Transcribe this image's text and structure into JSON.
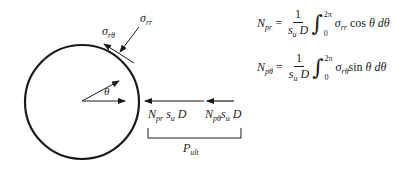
{
  "diagram": {
    "type": "free-body diagram of pipe cross-section",
    "circle": {
      "cx": 82,
      "cy": 102,
      "r": 57
    },
    "labels": {
      "sigma_rr": {
        "base": "σ",
        "sub": "rr"
      },
      "sigma_rtheta": {
        "base": "σ",
        "sub": "rθ"
      },
      "theta": "θ",
      "force_pr": {
        "N": "N",
        "N_sub": "pr",
        "s": "s",
        "s_sub": "u",
        "D": "D"
      },
      "force_ptheta": {
        "N": "N",
        "N_sub": "pθ",
        "s": "s",
        "s_sub": "u",
        "D": "D"
      },
      "p_ult": {
        "base": "P",
        "sub": "ult"
      }
    },
    "equations": [
      {
        "lhs": "N",
        "lhs_sub": "pr",
        "eq": "=",
        "numerator": "1",
        "den_s": "s",
        "den_s_sub": "u",
        "den_D": "D",
        "integral": "∫",
        "upper": "2π",
        "lower": "0",
        "sigma": "σ",
        "sigma_sub": "rr",
        "trig": "cos",
        "var": "θ",
        "d": "dθ"
      },
      {
        "lhs": "N",
        "lhs_sub": "pθ",
        "eq": "=",
        "numerator": "1",
        "den_s": "s",
        "den_s_sub": "u",
        "den_D": "D",
        "integral": "∫",
        "upper": "2π",
        "lower": "0",
        "sigma": "σ",
        "sigma_sub": "rθ",
        "trig": "sin",
        "var": "θ",
        "d": "dθ"
      }
    ],
    "colors": {
      "stroke": "#1a1a1a",
      "background": "#ffffff"
    }
  }
}
